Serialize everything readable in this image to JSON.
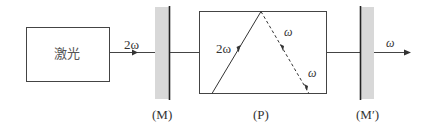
{
  "diagram": {
    "laser_box": {
      "label": "激光"
    },
    "input_beam": {
      "label": "2ω"
    },
    "mirror_left": {
      "label": "(M)"
    },
    "crystal": {
      "label": "(P)",
      "incident_beam_label": "2ω",
      "reflected_beam_label_upper": "ω",
      "reflected_beam_label_lower": "ω"
    },
    "mirror_right": {
      "label": "(M′)"
    },
    "output_beam": {
      "label": "ω"
    },
    "colors": {
      "line": "#333333",
      "mirror_shade": "#d8d8d8"
    }
  }
}
